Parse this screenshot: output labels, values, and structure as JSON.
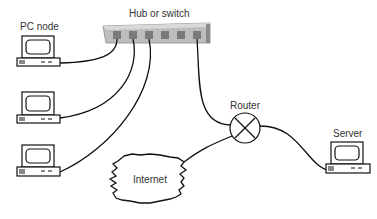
{
  "labels": {
    "hub": "Hub or switch",
    "pc": "PC node",
    "router": "Router",
    "server": "Server",
    "internet": "Internet"
  },
  "colors": {
    "line": "#111111",
    "hub_body": "#c8c8c8",
    "hub_edge": "#8a8a8a",
    "port": "#7a7a7a",
    "text": "#333333"
  },
  "nodes": [
    {
      "id": "pc-1",
      "type": "PC node"
    },
    {
      "id": "pc-2",
      "type": "PC node"
    },
    {
      "id": "pc-3",
      "type": "PC node"
    },
    {
      "id": "hub",
      "type": "Hub or switch",
      "ports": 6
    },
    {
      "id": "router",
      "type": "Router"
    },
    {
      "id": "server",
      "type": "Server"
    },
    {
      "id": "internet",
      "type": "Internet"
    }
  ],
  "edges": [
    [
      "pc-1",
      "hub"
    ],
    [
      "pc-2",
      "hub"
    ],
    [
      "pc-3",
      "hub"
    ],
    [
      "hub",
      "router"
    ],
    [
      "router",
      "internet"
    ],
    [
      "router",
      "server"
    ]
  ]
}
